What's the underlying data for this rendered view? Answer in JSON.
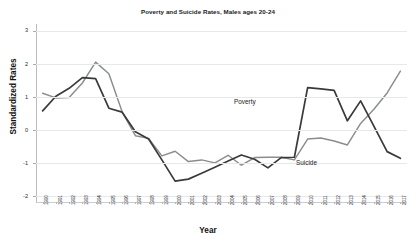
{
  "chart_data": {
    "type": "line",
    "title": "Poverty and Suicide Rates, Males ages 20-24",
    "xlabel": "Year",
    "ylabel": "Standardized Rates",
    "ylim": [
      -2.2,
      3.2
    ],
    "yticks": [
      3,
      2,
      1,
      0,
      -1,
      -2
    ],
    "ytick_labels": [
      "3",
      "2",
      "1",
      "0",
      "-1",
      "-2"
    ],
    "grid": true,
    "legend_position": "inline-annotation",
    "categories": [
      "1990",
      "1991",
      "1992",
      "1993",
      "1994",
      "1995",
      "1996",
      "1997",
      "1998",
      "1999",
      "2000",
      "2001",
      "2002",
      "2003",
      "2004",
      "2005",
      "2006",
      "2007",
      "2008",
      "2009",
      "2010",
      "2011",
      "2012",
      "2013",
      "2014",
      "2015",
      "2016",
      "2017"
    ],
    "series": [
      {
        "name": "Poverty",
        "color": "#3a3a3a",
        "values": [
          0.58,
          1.02,
          1.26,
          1.58,
          1.55,
          0.66,
          0.54,
          -0.05,
          -0.27,
          -0.9,
          -1.54,
          -1.48,
          -1.3,
          -1.12,
          -0.93,
          -0.75,
          -0.88,
          -1.14,
          -0.83,
          -0.82,
          1.28,
          1.24,
          1.2,
          0.28,
          0.88,
          0.12,
          -0.65,
          -0.85
        ]
      },
      {
        "name": "Suicide",
        "color": "#8a8d90",
        "values": [
          1.11,
          0.97,
          0.98,
          1.42,
          2.05,
          1.7,
          0.55,
          -0.17,
          -0.25,
          -0.78,
          -0.64,
          -0.95,
          -0.9,
          -0.99,
          -0.76,
          -1.06,
          -0.83,
          -0.82,
          -0.82,
          -0.9,
          -0.27,
          -0.24,
          -0.33,
          -0.45,
          0.2,
          0.63,
          1.12,
          1.78
        ]
      }
    ],
    "annotations": [
      {
        "text": "Poverty",
        "series": "Poverty"
      },
      {
        "text": "Suicide",
        "series": "Suicide"
      }
    ]
  }
}
